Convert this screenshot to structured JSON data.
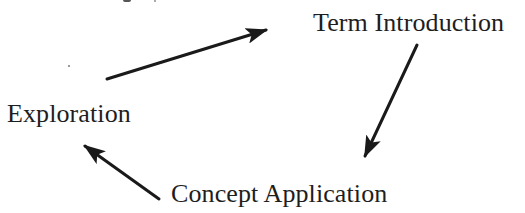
{
  "diagram": {
    "type": "cycle",
    "nodes": [
      {
        "id": "term",
        "label": "Term Introduction"
      },
      {
        "id": "exploration",
        "label": "Exploration"
      },
      {
        "id": "concept",
        "label": "Concept Application"
      }
    ],
    "edges": [
      {
        "from": "exploration",
        "to": "term"
      },
      {
        "from": "term",
        "to": "concept"
      },
      {
        "from": "concept",
        "to": "exploration"
      }
    ],
    "colors": {
      "text": "#1e1e1e",
      "arrow": "#1a1a1a",
      "background": "#ffffff"
    }
  }
}
